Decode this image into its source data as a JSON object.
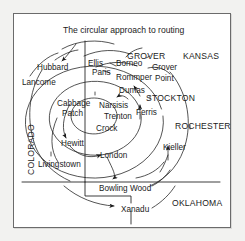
{
  "diagram": {
    "title": "The circular approach to routing",
    "type": "spiral-route-map",
    "frame": {
      "border_color": "#6b6b6b",
      "background": "#ffffff",
      "page_background": "#f2f2f0"
    },
    "ink_color": "#1b1b1b",
    "regions": [
      {
        "name": "KANSAS",
        "orientation": "horizontal",
        "x": 183,
        "y": 52
      },
      {
        "name": "COLORADO",
        "orientation": "vertical",
        "x": 27,
        "y": 175
      },
      {
        "name": "OKLAHOMA",
        "orientation": "horizontal",
        "x": 172,
        "y": 199
      },
      {
        "name": "STOCKTON",
        "orientation": "horizontal",
        "x": 146,
        "y": 94
      },
      {
        "name": "ROCHESTER",
        "orientation": "horizontal",
        "x": 175,
        "y": 122
      },
      {
        "name": "GROVER",
        "orientation": "horizontal",
        "x": 127,
        "y": 52
      }
    ],
    "cities": [
      {
        "name": "Hubbard",
        "x": 37,
        "y": 64
      },
      {
        "name": "Lancome",
        "x": 22,
        "y": 79
      },
      {
        "name": "Ellis",
        "x": 88,
        "y": 60
      },
      {
        "name": "Paris",
        "x": 92,
        "y": 69
      },
      {
        "name": "Borneo",
        "x": 116,
        "y": 60
      },
      {
        "name": "Grover",
        "x": 152,
        "y": 64
      },
      {
        "name": "Point",
        "x": 155,
        "y": 75
      },
      {
        "name": "Rommper",
        "x": 116,
        "y": 74
      },
      {
        "name": "Dumas",
        "x": 119,
        "y": 87
      },
      {
        "name": "Cabbage",
        "x": 57,
        "y": 100
      },
      {
        "name": "Patch",
        "x": 62,
        "y": 110
      },
      {
        "name": "Narsisis",
        "x": 99,
        "y": 102
      },
      {
        "name": "Trenton",
        "x": 104,
        "y": 113
      },
      {
        "name": "Crock",
        "x": 96,
        "y": 125
      },
      {
        "name": "Ferris",
        "x": 136,
        "y": 109
      },
      {
        "name": "Hewitt",
        "x": 61,
        "y": 140
      },
      {
        "name": "London",
        "x": 100,
        "y": 152
      },
      {
        "name": "Kieller",
        "x": 163,
        "y": 144
      },
      {
        "name": "Livingstown",
        "x": 38,
        "y": 161
      },
      {
        "name": "Bowling Wood",
        "x": 99,
        "y": 185
      },
      {
        "name": "Xanadu",
        "x": 121,
        "y": 206
      }
    ]
  }
}
